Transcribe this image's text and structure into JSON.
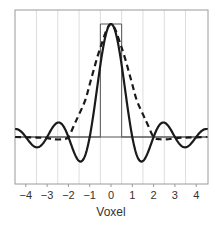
{
  "chart_data": {
    "type": "line",
    "title": "",
    "xlabel": "Voxel",
    "ylabel": "",
    "xlim": [
      -4.5,
      4.55
    ],
    "ylim": [
      -0.42,
      1.12
    ],
    "grid": {
      "vertical_at": [
        -3.5,
        -2.5,
        -1.5,
        -0.5,
        0.5,
        1.5,
        2.5,
        3.5
      ],
      "horizontal": false
    },
    "x_ticks": [
      -4,
      -3,
      -2,
      -1,
      0,
      1,
      2,
      3,
      4
    ],
    "x_tick_labels": [
      "−4",
      "−3",
      "−2",
      "−1",
      "0",
      "1",
      "2",
      "3",
      "4"
    ],
    "legend": [],
    "series": [
      {
        "name": "rect (box)",
        "style": "thin-solid",
        "color": "#555555",
        "x": [
          -4.5,
          -0.5,
          -0.5,
          0.5,
          0.5,
          4.55
        ],
        "y": [
          0,
          0,
          1,
          1,
          0,
          0
        ]
      },
      {
        "name": "sinc",
        "style": "thick-solid",
        "color": "#1a1a1a",
        "function": "sin(pi x)/(pi x)",
        "x": [
          -4.5,
          -4,
          -3.5,
          -3,
          -2.5,
          -2,
          -1.5,
          -1,
          -0.5,
          0,
          0.5,
          1,
          1.5,
          2,
          2.5,
          3,
          3.5,
          4,
          4.5
        ],
        "y": [
          0.071,
          0,
          -0.091,
          0,
          0.127,
          0,
          -0.212,
          0,
          0.637,
          1,
          0.637,
          0,
          -0.212,
          0,
          0.127,
          0,
          -0.091,
          0,
          0.071
        ]
      },
      {
        "name": "dashed kernel",
        "style": "thick-dashed",
        "color": "#1a1a1a",
        "x": [
          -4.5,
          -3.5,
          -3,
          -2.7,
          -2.3,
          -2,
          -1.7,
          -1.5,
          -1.2,
          -0.95,
          -0.5,
          0,
          0.5,
          0.95,
          1.2,
          1.5,
          1.7,
          2,
          2.3,
          2.7,
          3,
          3.5,
          4.5
        ],
        "y": [
          0,
          -0.005,
          -0.01,
          -0.02,
          -0.02,
          0,
          0.12,
          0.2,
          0.33,
          0.5,
          0.79,
          1,
          0.79,
          0.5,
          0.33,
          0.2,
          0.12,
          0,
          -0.02,
          -0.02,
          -0.01,
          -0.005,
          0
        ]
      }
    ]
  },
  "colors": {
    "frame": "#9a9a9a",
    "grid": "#dddddd",
    "baseline": "#555555",
    "curve": "#1a1a1a"
  }
}
